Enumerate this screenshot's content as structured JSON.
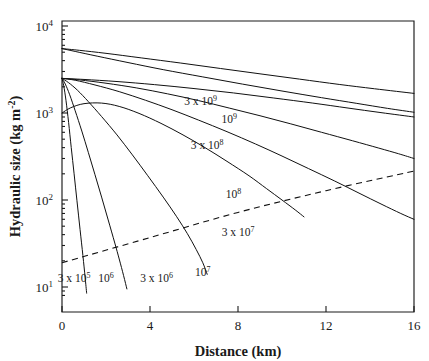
{
  "chart_data": {
    "type": "line",
    "title": "",
    "xlabel": "Distance (km)",
    "ylabel": "Hydraulic size (kg m-2)",
    "ylabel_display": "Hydraulic size (kg m",
    "ylabel_exponent": "-2",
    "ylabel_tail": ")",
    "xscale": "linear",
    "yscale": "log",
    "xlim": [
      0,
      16
    ],
    "ylim": [
      7,
      10000
    ],
    "grid": false,
    "legend": "inline-curve-labels",
    "xticks": [
      "0",
      "4",
      "8",
      "12",
      "16"
    ],
    "xtick_values": [
      0,
      4,
      8,
      12,
      16
    ],
    "yticks": [
      {
        "mantissa": "10",
        "exponent": "4",
        "value": 10000
      },
      {
        "mantissa": "10",
        "exponent": "3",
        "value": 1000
      },
      {
        "mantissa": "10",
        "exponent": "2",
        "value": 100
      },
      {
        "mantissa": "10",
        "exponent": "1",
        "value": 10
      }
    ],
    "series": [
      {
        "name": "3 x 10^5",
        "label_mantissa": "3 x 10",
        "label_exponent": "5",
        "label_x_km": 0.55,
        "label_y": 11.5,
        "points_xy": [
          [
            0,
            2500
          ],
          [
            0.08,
            2050
          ],
          [
            0.18,
            1400
          ],
          [
            0.3,
            780
          ],
          [
            0.42,
            400
          ],
          [
            0.55,
            200
          ],
          [
            0.68,
            98
          ],
          [
            0.82,
            46
          ],
          [
            0.95,
            23
          ],
          [
            1.05,
            13
          ],
          [
            1.12,
            8.5
          ]
        ]
      },
      {
        "name": "10^6",
        "label_mantissa": "10",
        "label_exponent": "6",
        "label_x_km": 2.0,
        "label_y": 11.5,
        "points_xy": [
          [
            0,
            2500
          ],
          [
            0.15,
            2150
          ],
          [
            0.35,
            1620
          ],
          [
            0.6,
            1060
          ],
          [
            0.9,
            620
          ],
          [
            1.2,
            350
          ],
          [
            1.5,
            195
          ],
          [
            1.8,
            108
          ],
          [
            2.1,
            59
          ],
          [
            2.4,
            32
          ],
          [
            2.6,
            21
          ],
          [
            2.8,
            13.5
          ],
          [
            2.95,
            9.5
          ]
        ]
      },
      {
        "name": "3 x 10^6",
        "label_mantissa": "3 x 10",
        "label_exponent": "6",
        "label_x_km": 4.3,
        "label_y": 11.5,
        "points_xy": [
          [
            0,
            2500
          ],
          [
            0.3,
            2230
          ],
          [
            0.7,
            1830
          ],
          [
            1.2,
            1350
          ],
          [
            1.8,
            910
          ],
          [
            2.5,
            560
          ],
          [
            3.2,
            330
          ],
          [
            3.9,
            190
          ],
          [
            4.6,
            108
          ],
          [
            5.2,
            65
          ],
          [
            5.7,
            41
          ],
          [
            6.1,
            27
          ],
          [
            6.4,
            19
          ],
          [
            6.6,
            14
          ]
        ]
      },
      {
        "name": "10^7",
        "label_mantissa": "10",
        "label_exponent": "7",
        "label_x_km": 6.4,
        "label_y": 13.5,
        "points_xy": [
          [
            0,
            1000
          ],
          [
            0.4,
            1150
          ],
          [
            1.0,
            1280
          ],
          [
            1.8,
            1300
          ],
          [
            2.6,
            1190
          ],
          [
            3.5,
            990
          ],
          [
            4.5,
            760
          ],
          [
            5.5,
            560
          ],
          [
            6.5,
            400
          ],
          [
            7.5,
            278
          ],
          [
            8.5,
            190
          ],
          [
            9.3,
            135
          ],
          [
            10.0,
            100
          ],
          [
            10.6,
            77
          ],
          [
            11.0,
            64
          ]
        ]
      },
      {
        "name": "3 x 10^7",
        "label_mantissa": "3 x 10",
        "label_exponent": "7",
        "label_x_km": 8.0,
        "label_y": 39,
        "points_xy": [
          [
            0,
            2500
          ],
          [
            0.6,
            2380
          ],
          [
            1.5,
            2100
          ],
          [
            2.6,
            1760
          ],
          [
            3.8,
            1400
          ],
          [
            5.0,
            1090
          ],
          [
            6.2,
            830
          ],
          [
            7.5,
            610
          ],
          [
            8.8,
            440
          ],
          [
            10.0,
            320
          ],
          [
            11.2,
            230
          ],
          [
            12.4,
            165
          ],
          [
            13.5,
            120
          ],
          [
            14.5,
            90
          ],
          [
            15.4,
            70
          ],
          [
            16,
            60
          ]
        ]
      },
      {
        "name": "10^8",
        "label_mantissa": "10",
        "label_exponent": "8",
        "label_x_km": 7.8,
        "label_y": 105,
        "points_xy": [
          [
            0,
            2500
          ],
          [
            0.8,
            2400
          ],
          [
            2.0,
            2200
          ],
          [
            3.4,
            1940
          ],
          [
            4.8,
            1660
          ],
          [
            6.2,
            1390
          ],
          [
            7.6,
            1140
          ],
          [
            9.0,
            930
          ],
          [
            10.4,
            750
          ],
          [
            11.8,
            600
          ],
          [
            13.2,
            480
          ],
          [
            14.4,
            395
          ],
          [
            15.3,
            340
          ],
          [
            16,
            300
          ]
        ]
      },
      {
        "name": "3 x 10^8",
        "label_mantissa": "3 x 10",
        "label_exponent": "8",
        "label_x_km": 6.6,
        "label_y": 390,
        "points_xy": [
          [
            0,
            2500
          ],
          [
            1.0,
            2430
          ],
          [
            2.5,
            2300
          ],
          [
            4.2,
            2120
          ],
          [
            6.0,
            1910
          ],
          [
            7.8,
            1700
          ],
          [
            9.6,
            1490
          ],
          [
            11.4,
            1300
          ],
          [
            13.0,
            1140
          ],
          [
            14.5,
            1010
          ],
          [
            16,
            900
          ]
        ]
      },
      {
        "name": "10^9",
        "label_mantissa": "10",
        "label_exponent": "9",
        "label_x_km": 7.6,
        "label_y": 760,
        "points_xy": [
          [
            0,
            5500
          ],
          [
            0.6,
            5100
          ],
          [
            1.6,
            4500
          ],
          [
            3.0,
            3800
          ],
          [
            4.6,
            3150
          ],
          [
            6.4,
            2600
          ],
          [
            8.2,
            2150
          ],
          [
            10.0,
            1790
          ],
          [
            11.8,
            1500
          ],
          [
            13.4,
            1290
          ],
          [
            14.8,
            1130
          ],
          [
            16,
            1020
          ]
        ]
      },
      {
        "name": "3 x 10^9",
        "label_mantissa": "3 x 10",
        "label_exponent": "9",
        "label_x_km": 6.3,
        "label_y": 1220,
        "points_xy": [
          [
            0,
            5500
          ],
          [
            0.8,
            5250
          ],
          [
            2.0,
            4850
          ],
          [
            3.6,
            4300
          ],
          [
            5.4,
            3750
          ],
          [
            7.2,
            3250
          ],
          [
            9.0,
            2820
          ],
          [
            10.8,
            2450
          ],
          [
            12.6,
            2130
          ],
          [
            14.2,
            1900
          ],
          [
            16,
            1680
          ]
        ]
      }
    ],
    "reference_line": {
      "name": "dashed-reference-line",
      "style": "dashed",
      "points_xy": [
        [
          0,
          19
        ],
        [
          4,
          37
        ],
        [
          8,
          72
        ],
        [
          12,
          128
        ],
        [
          16,
          215
        ]
      ]
    }
  },
  "annotations": {
    "xaxis_title": "Distance (km)"
  }
}
